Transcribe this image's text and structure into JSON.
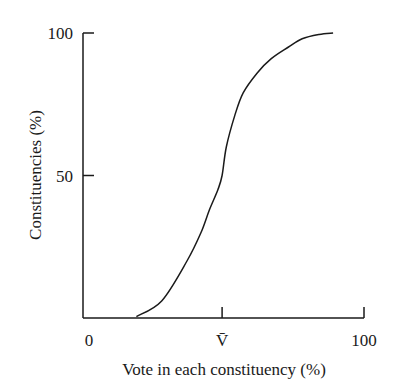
{
  "chart_data": {
    "type": "line",
    "title": "",
    "xlabel": "Vote in each constituency (%)",
    "ylabel": "Constituencies (%)",
    "xlim": [
      0,
      100
    ],
    "ylim": [
      0,
      100
    ],
    "grid": false,
    "x_ticks": [
      {
        "value": 0,
        "label": "0",
        "tick_mark": false
      },
      {
        "value": 49.5,
        "label": "V̄",
        "tick_mark": true
      },
      {
        "value": 100,
        "label": "100",
        "tick_mark": true
      }
    ],
    "y_ticks": [
      {
        "value": 50,
        "label": "50"
      },
      {
        "value": 100,
        "label": "100"
      }
    ],
    "series": [
      {
        "name": "cumulative distribution",
        "x": [
          19,
          28,
          37,
          42,
          45,
          48,
          49.5,
          51,
          54,
          57,
          62,
          67,
          73,
          78,
          84,
          89
        ],
        "y": [
          0.5,
          6,
          20,
          30,
          38,
          45,
          50,
          60,
          71,
          79,
          86,
          91,
          95,
          98,
          99.5,
          100
        ]
      }
    ]
  }
}
